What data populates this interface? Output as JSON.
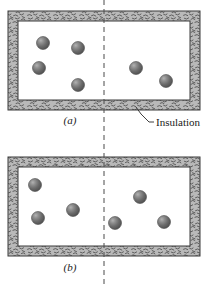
{
  "figure": {
    "panels": [
      {
        "id": "panel-a",
        "label": "(a)",
        "label_x": 70,
        "label_y": 124,
        "box": {
          "x": 8,
          "y": 11,
          "width": 192,
          "height": 99
        },
        "wall_thickness": 10,
        "chambers": [
          {
            "name": "left-chamber",
            "molecule_count": 4,
            "molecules": [
              {
                "cx": 43,
                "cy": 43,
                "r": 6.5
              },
              {
                "cx": 78,
                "cy": 48,
                "r": 6.5
              },
              {
                "cx": 39,
                "cy": 68,
                "r": 6.5
              },
              {
                "cx": 78,
                "cy": 85,
                "r": 6.5
              }
            ]
          },
          {
            "name": "right-chamber",
            "molecule_count": 2,
            "molecules": [
              {
                "cx": 136,
                "cy": 68,
                "r": 6.5
              },
              {
                "cx": 166,
                "cy": 81,
                "r": 6.5
              }
            ]
          }
        ]
      },
      {
        "id": "panel-b",
        "label": "(b)",
        "label_x": 70,
        "label_y": 271,
        "box": {
          "x": 8,
          "y": 157,
          "width": 192,
          "height": 99
        },
        "wall_thickness": 10,
        "chambers": [
          {
            "name": "left-chamber",
            "molecule_count": 3,
            "molecules": [
              {
                "cx": 35,
                "cy": 185,
                "r": 6.5
              },
              {
                "cx": 73,
                "cy": 210,
                "r": 6.5
              },
              {
                "cx": 38,
                "cy": 218,
                "r": 6.5
              }
            ]
          },
          {
            "name": "right-chamber",
            "molecule_count": 3,
            "molecules": [
              {
                "cx": 140,
                "cy": 197,
                "r": 6.5
              },
              {
                "cx": 115,
                "cy": 223,
                "r": 6.5
              },
              {
                "cx": 164,
                "cy": 222,
                "r": 6.5
              }
            ]
          }
        ]
      }
    ],
    "divider": {
      "name": "membrane-dashed-line",
      "x": 104,
      "y_top": 0,
      "y_bottom": 285,
      "dash_pattern": "5 4"
    },
    "callout": {
      "label": "Insulation",
      "text_x": 150,
      "text_y": 125,
      "leader_points": "136,107 141,114 149,122 154,122"
    },
    "colors": {
      "insulation_fill": "#b9b9b9",
      "insulation_hatch": "#4a4a4a",
      "outline": "#3a3a3a",
      "chamber_fill": "#ffffff",
      "molecule_dark": "#5d5d5d",
      "molecule_mid": "#7d7d7d",
      "molecule_light": "#a8a8a8",
      "molecule_edge": "#4a4a4a",
      "text": "#1a1a1a",
      "dash_line": "#4a4a4a"
    }
  }
}
